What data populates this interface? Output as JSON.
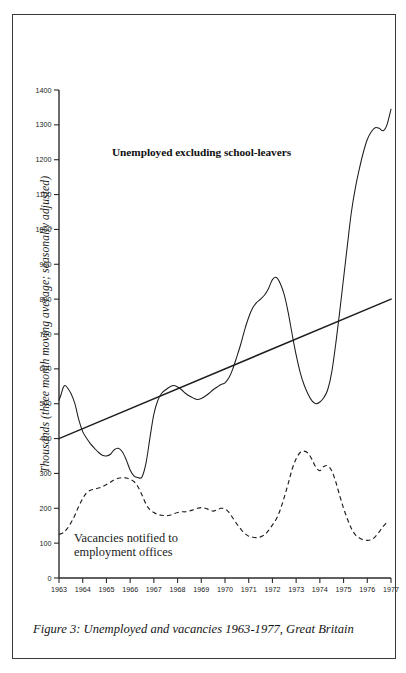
{
  "figure": {
    "caption": "Figure 3: Unemployed and vacancies 1963-1977, Great Britain",
    "y_axis_title": "Thousands (three month moving average; seasonally adjusted)",
    "annotation_unemployed": "Unemployed excluding school-leavers",
    "annotation_vacancies_line1": "Vacancies notified to",
    "annotation_vacancies_line2": "employment offices",
    "ink_color": "#1d1d1d",
    "paper_color": "#ffffff"
  },
  "chart_data": {
    "type": "line",
    "title": "Figure 3: Unemployed and vacancies 1963-1977, Great Britain",
    "xlabel": "",
    "ylabel": "Thousands (three month moving average; seasonally adjusted)",
    "xlim": [
      1963,
      1977
    ],
    "ylim": [
      0,
      1400
    ],
    "grid": false,
    "legend_position": "inline-annotations",
    "ytick_labels": [
      "0",
      "100",
      "200",
      "300",
      "400",
      "500",
      "600",
      "700",
      "800",
      "900",
      "1000",
      "1100",
      "1200",
      "1300",
      "1400"
    ],
    "ytick_values": [
      0,
      100,
      200,
      300,
      400,
      500,
      600,
      700,
      800,
      900,
      1000,
      1100,
      1200,
      1300,
      1400
    ],
    "xtick_labels": [
      "1963",
      "1964",
      "1965",
      "1966",
      "1967",
      "1968",
      "1969",
      "1970",
      "1971",
      "1972",
      "1973",
      "1974",
      "1975",
      "1976",
      "1977"
    ],
    "xtick_values": [
      1963,
      1964,
      1965,
      1966,
      1967,
      1968,
      1969,
      1970,
      1971,
      1972,
      1973,
      1974,
      1975,
      1976,
      1977
    ],
    "series": [
      {
        "name": "Unemployed excluding school-leavers",
        "style": "solid",
        "x": [
          1963.0,
          1963.08,
          1963.17,
          1963.25,
          1963.33,
          1963.5,
          1963.67,
          1963.83,
          1964.0,
          1964.17,
          1964.33,
          1964.5,
          1964.67,
          1964.83,
          1965.0,
          1965.17,
          1965.33,
          1965.5,
          1965.67,
          1965.83,
          1966.0,
          1966.17,
          1966.33,
          1966.5,
          1966.67,
          1966.83,
          1967.0,
          1967.17,
          1967.33,
          1967.5,
          1967.67,
          1967.83,
          1968.0,
          1968.17,
          1968.33,
          1968.5,
          1968.67,
          1968.83,
          1969.0,
          1969.17,
          1969.33,
          1969.5,
          1969.67,
          1969.83,
          1970.0,
          1970.17,
          1970.33,
          1970.5,
          1970.67,
          1970.83,
          1971.0,
          1971.17,
          1971.33,
          1971.5,
          1971.67,
          1971.83,
          1972.0,
          1972.17,
          1972.33,
          1972.5,
          1972.67,
          1972.83,
          1973.0,
          1973.17,
          1973.33,
          1973.5,
          1973.67,
          1973.83,
          1974.0,
          1974.17,
          1974.33,
          1974.5,
          1974.67,
          1974.83,
          1975.0,
          1975.17,
          1975.33,
          1975.5,
          1975.67,
          1975.83,
          1976.0,
          1976.17,
          1976.33,
          1976.5,
          1976.67,
          1976.83,
          1977.0
        ],
        "y": [
          510,
          525,
          545,
          552,
          548,
          530,
          500,
          455,
          420,
          400,
          385,
          372,
          360,
          352,
          350,
          355,
          368,
          372,
          362,
          340,
          310,
          292,
          288,
          290,
          330,
          400,
          470,
          510,
          530,
          540,
          548,
          552,
          548,
          540,
          530,
          522,
          516,
          512,
          515,
          522,
          530,
          540,
          548,
          555,
          560,
          575,
          600,
          635,
          672,
          712,
          748,
          775,
          790,
          800,
          812,
          830,
          856,
          862,
          845,
          812,
          760,
          700,
          640,
          590,
          555,
          528,
          508,
          500,
          505,
          518,
          540,
          590,
          672,
          760,
          860,
          960,
          1050,
          1120,
          1175,
          1220,
          1258,
          1280,
          1292,
          1290,
          1283,
          1300,
          1345
        ]
      },
      {
        "name": "Vacancies notified to employment offices",
        "style": "dashed",
        "x": [
          1963.0,
          1963.17,
          1963.33,
          1963.5,
          1963.67,
          1963.83,
          1964.0,
          1964.17,
          1964.33,
          1964.5,
          1964.67,
          1964.83,
          1965.0,
          1965.17,
          1965.33,
          1965.5,
          1965.67,
          1965.83,
          1966.0,
          1966.17,
          1966.33,
          1966.5,
          1966.67,
          1966.83,
          1967.0,
          1967.17,
          1967.33,
          1967.5,
          1967.67,
          1967.83,
          1968.0,
          1968.17,
          1968.33,
          1968.5,
          1968.67,
          1968.83,
          1969.0,
          1969.17,
          1969.33,
          1969.5,
          1969.67,
          1969.83,
          1970.0,
          1970.17,
          1970.33,
          1970.5,
          1970.67,
          1970.83,
          1971.0,
          1971.17,
          1971.33,
          1971.5,
          1971.67,
          1971.83,
          1972.0,
          1972.17,
          1972.33,
          1972.5,
          1972.67,
          1972.83,
          1973.0,
          1973.17,
          1973.33,
          1973.5,
          1973.67,
          1973.83,
          1974.0,
          1974.17,
          1974.33,
          1974.5,
          1974.67,
          1974.83,
          1975.0,
          1975.17,
          1975.33,
          1975.5,
          1975.67,
          1975.83,
          1976.0,
          1976.17,
          1976.33,
          1976.5,
          1976.67,
          1976.83
        ],
        "y": [
          125,
          130,
          140,
          158,
          180,
          205,
          228,
          245,
          252,
          255,
          258,
          262,
          268,
          275,
          282,
          286,
          288,
          287,
          283,
          276,
          262,
          238,
          212,
          196,
          188,
          182,
          180,
          179,
          180,
          184,
          188,
          190,
          190,
          192,
          196,
          200,
          202,
          200,
          196,
          192,
          196,
          200,
          198,
          188,
          172,
          155,
          140,
          128,
          120,
          117,
          116,
          118,
          124,
          136,
          152,
          170,
          196,
          232,
          272,
          312,
          342,
          360,
          364,
          358,
          340,
          318,
          308,
          320,
          322,
          308,
          276,
          238,
          200,
          168,
          142,
          124,
          115,
          110,
          108,
          110,
          118,
          132,
          148,
          160
        ]
      },
      {
        "name": "Trend line",
        "style": "solid-straight",
        "x": [
          1963.0,
          1977.0
        ],
        "y": [
          400,
          800
        ]
      }
    ],
    "annotations": [
      {
        "text": "Unemployed excluding school-leavers",
        "x": 1966.8,
        "y": 1180
      },
      {
        "text": "Vacancies notified to employment offices",
        "x": 1964.3,
        "y": 140
      }
    ]
  }
}
